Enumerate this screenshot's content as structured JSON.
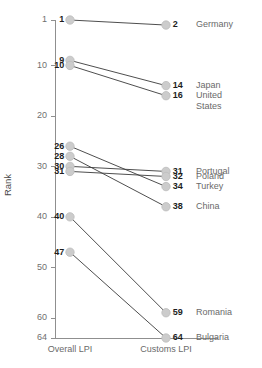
{
  "chart_data": {
    "type": "line",
    "subtype": "slopegraph",
    "title": "",
    "xlabel": "",
    "ylabel": "Rank",
    "categories": [
      "Overall LPI",
      "Customs LPI"
    ],
    "yticks": [
      1,
      10,
      20,
      30,
      40,
      50,
      60,
      64
    ],
    "ylim": [
      1,
      64
    ],
    "y_inverted": true,
    "grid": false,
    "legend": "none",
    "series": [
      {
        "name": "Germany",
        "values": [
          1,
          2
        ],
        "left_label": "1",
        "right_label": "2"
      },
      {
        "name": "Japan",
        "values": [
          9,
          14
        ],
        "left_label": "9",
        "right_label": "14"
      },
      {
        "name": "United States",
        "values": [
          10,
          16
        ],
        "left_label": "10",
        "right_label": "16"
      },
      {
        "name": "Portugal",
        "values": [
          30,
          31
        ],
        "left_label": "30",
        "right_label": "31"
      },
      {
        "name": "Poland",
        "values": [
          31,
          32
        ],
        "left_label": "31",
        "right_label": "32"
      },
      {
        "name": "Turkey",
        "values": [
          26,
          34
        ],
        "left_label": "26",
        "right_label": "34"
      },
      {
        "name": "China",
        "values": [
          28,
          38
        ],
        "left_label": "28",
        "right_label": "38"
      },
      {
        "name": "Romania",
        "values": [
          40,
          59
        ],
        "left_label": "40",
        "right_label": "59"
      },
      {
        "name": "Bulgaria",
        "values": [
          47,
          64
        ],
        "left_label": "47",
        "right_label": "64"
      }
    ]
  },
  "axis": {
    "y_title": "Rank",
    "tick_labels": [
      "1",
      "10",
      "20",
      "30",
      "40",
      "50",
      "60",
      "64"
    ],
    "x_left_label": "Overall LPI",
    "x_right_label": "Customs LPI"
  },
  "colors": {
    "line": "#3a3a3a",
    "dot_fill": "#cccccc",
    "dot_stroke": "#bdbdbd",
    "axis": "#8f8f8f",
    "value_text": "#1d1d1d",
    "name_text": "#6a6a6a",
    "tick_text": "#6f6f6f",
    "background": "#ffffff"
  },
  "right_labels": [
    {
      "value": "2",
      "name": "Germany"
    },
    {
      "value": "14",
      "name": "Japan"
    },
    {
      "value": "16",
      "name": "United"
    },
    {
      "value": "",
      "name": "States"
    },
    {
      "value": "31",
      "name": "Portugal"
    },
    {
      "value": "32",
      "name": "Poland"
    },
    {
      "value": "34",
      "name": "Turkey"
    },
    {
      "value": "38",
      "name": "China"
    },
    {
      "value": "59",
      "name": "Romania"
    },
    {
      "value": "64",
      "name": "Bulgaria"
    }
  ]
}
